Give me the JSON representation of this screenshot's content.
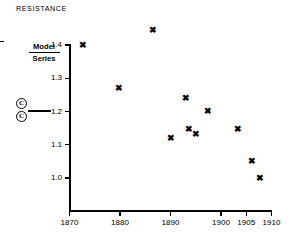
{
  "figure": {
    "title": "RESISTANCE",
    "left_annotation": {
      "numerator": "Model",
      "denominator": "Series",
      "marker_ring_glyph": "C",
      "ring_count": 2
    }
  },
  "chart_data": {
    "type": "scatter",
    "title": "RESISTANCE",
    "xlabel": "",
    "ylabel": "",
    "grid": false,
    "legend": "none",
    "marker": "x",
    "marker_color": "#000000",
    "xlim": [
      1870,
      1910
    ],
    "ylim": [
      0.93,
      1.46
    ],
    "xticks": [
      1870,
      1880,
      1890,
      1900,
      1905,
      1910
    ],
    "xtick_labels": [
      "1870",
      "1880",
      "1890",
      "1900",
      "1905",
      "1910"
    ],
    "yticks": [
      1.0,
      1.1,
      1.2,
      1.3,
      1.4
    ],
    "ytick_labels": [
      "1.0",
      "1.1",
      "1.2",
      "1.3",
      "1.4"
    ],
    "points": [
      {
        "x": 1872.5,
        "y": 1.4
      },
      {
        "x": 1879.7,
        "y": 1.27
      },
      {
        "x": 1886.4,
        "y": 1.445
      },
      {
        "x": 1890.0,
        "y": 1.12
      },
      {
        "x": 1893.0,
        "y": 1.24
      },
      {
        "x": 1893.5,
        "y": 1.145
      },
      {
        "x": 1895.0,
        "y": 1.13
      },
      {
        "x": 1897.3,
        "y": 1.2
      },
      {
        "x": 1903.2,
        "y": 1.145
      },
      {
        "x": 1906.0,
        "y": 1.05
      },
      {
        "x": 1907.6,
        "y": 1.0
      }
    ]
  }
}
